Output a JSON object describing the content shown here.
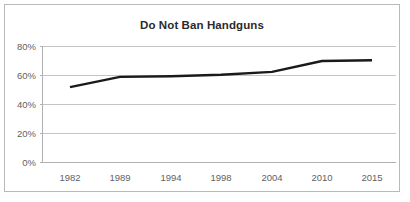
{
  "chart_data": {
    "type": "line",
    "title": "Do Not Ban Handguns",
    "xlabel": "",
    "ylabel": "",
    "categories": [
      "1982",
      "1989",
      "1994",
      "1998",
      "2004",
      "2010",
      "2015"
    ],
    "values": [
      52,
      59,
      59.5,
      60.5,
      62.5,
      70,
      70.5
    ],
    "series": [
      {
        "name": "Do Not Ban Handguns",
        "values": [
          52,
          59,
          59.5,
          60.5,
          62.5,
          70,
          70.5
        ],
        "color": "#1a1a1a"
      }
    ],
    "ylim": [
      0,
      80
    ],
    "ytick_labels": [
      "0%",
      "20%",
      "40%",
      "60%",
      "80%"
    ],
    "ytick_values": [
      0,
      20,
      40,
      60,
      80
    ],
    "grid": true,
    "grid_axis": "y",
    "legend": false,
    "legend_position": "none",
    "value_suffix": "%"
  },
  "figure": {
    "border_color": "#b9b9b9",
    "background_color": "#ffffff",
    "gridline_color": "#c4c4c4",
    "axis_color": "#b0b0b0",
    "title_color": "#2b2b2b",
    "tick_label_color": "#5f5f5f"
  }
}
